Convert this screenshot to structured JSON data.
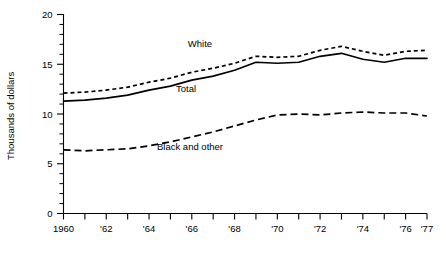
{
  "chart_data": {
    "type": "line",
    "title": "",
    "xlabel": "",
    "ylabel": "Thousands of dollars",
    "xlim": [
      1960,
      1977
    ],
    "ylim": [
      0,
      20
    ],
    "grid": false,
    "legend_position": "inline-annotations",
    "x": [
      1960,
      1961,
      1962,
      1963,
      1964,
      1965,
      1966,
      1967,
      1968,
      1969,
      1970,
      1971,
      1972,
      1973,
      1974,
      1975,
      1976,
      1977
    ],
    "xtick_labels": [
      "1960",
      "'61",
      "'62",
      "'63",
      "'64",
      "'65",
      "'66",
      "'67",
      "'68",
      "'69",
      "'70",
      "'71",
      "'72",
      "'73",
      "'74",
      "'75",
      "'76",
      "'77"
    ],
    "xtick_labels_shown": [
      "1960",
      "'62",
      "'64",
      "'66",
      "'68",
      "'70",
      "'72",
      "'74",
      "'76",
      "'77"
    ],
    "ytick_labels": [
      "0",
      "5",
      "10",
      "15",
      "20"
    ],
    "ytick_values": [
      0,
      5,
      10,
      15,
      20
    ],
    "yminor_step": 1,
    "series": [
      {
        "name": "White",
        "style": "dotted",
        "values": [
          12.1,
          12.2,
          12.4,
          12.7,
          13.2,
          13.6,
          14.2,
          14.6,
          15.1,
          15.8,
          15.7,
          15.8,
          16.4,
          16.8,
          16.3,
          15.9,
          16.3,
          16.4
        ]
      },
      {
        "name": "Total",
        "style": "solid",
        "values": [
          11.3,
          11.4,
          11.6,
          11.9,
          12.4,
          12.8,
          13.4,
          13.8,
          14.4,
          15.2,
          15.1,
          15.2,
          15.8,
          16.1,
          15.5,
          15.2,
          15.6,
          15.6
        ]
      },
      {
        "name": "Black and other",
        "style": "dashed",
        "values": [
          6.4,
          6.3,
          6.4,
          6.5,
          6.8,
          7.2,
          7.7,
          8.2,
          8.8,
          9.4,
          9.9,
          10.0,
          9.9,
          10.1,
          10.2,
          10.1,
          10.1,
          9.8
        ]
      }
    ],
    "annotations": [
      {
        "text": "White",
        "x_px": 200,
        "y_px": 47
      },
      {
        "text": "Total",
        "x_px": 186,
        "y_px": 92
      },
      {
        "text": "Black and other",
        "x_px": 190,
        "y_px": 150
      }
    ]
  }
}
